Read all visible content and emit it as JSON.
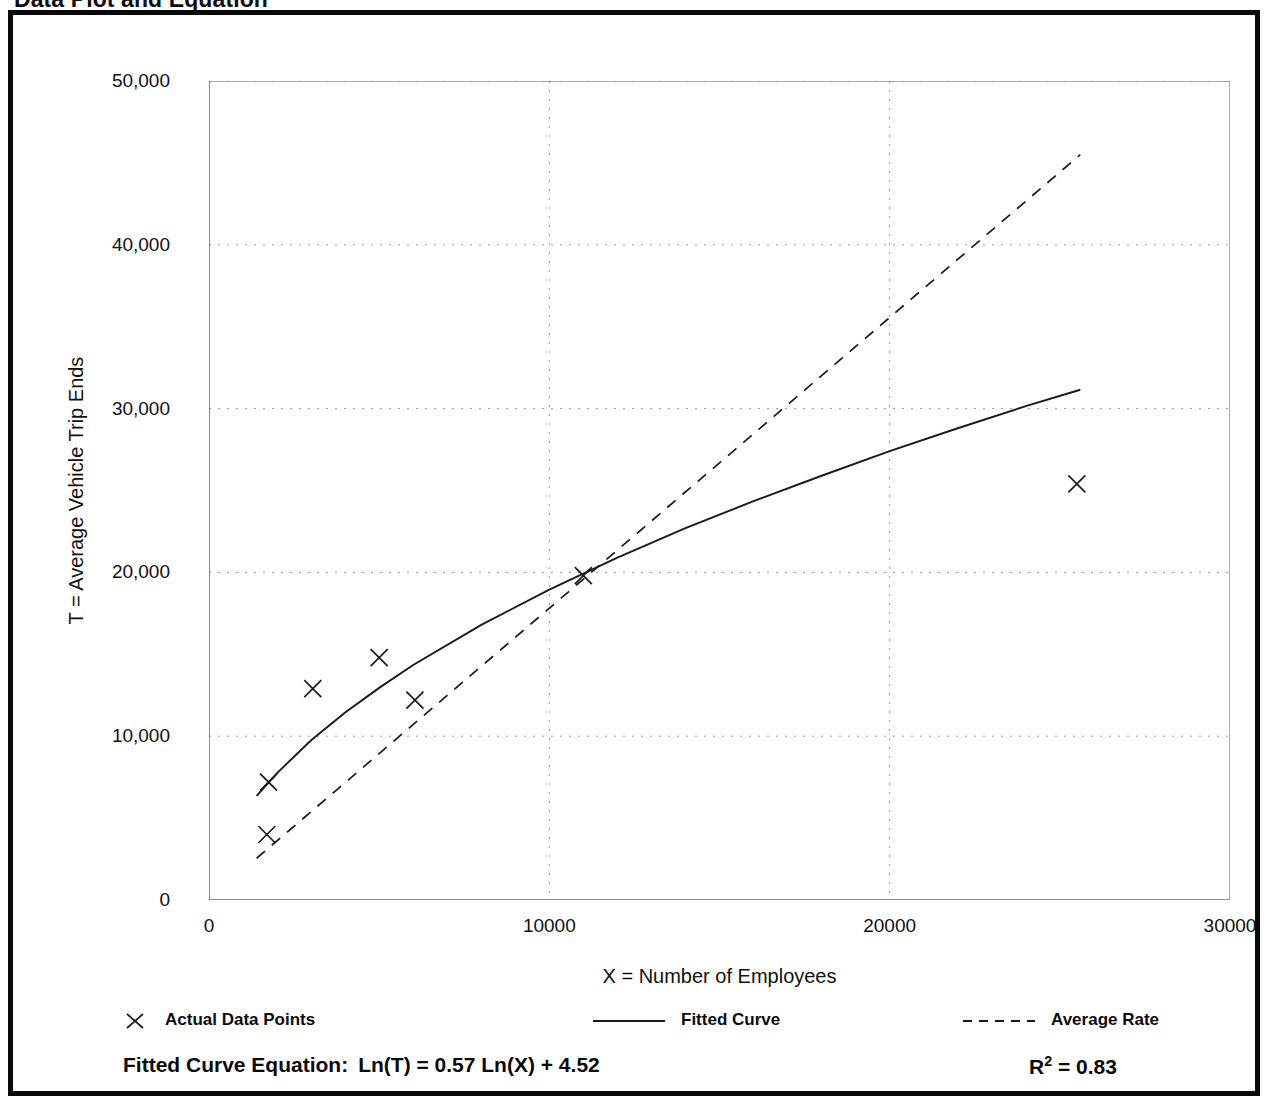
{
  "page": {
    "title": "Data Plot and Equation"
  },
  "chart_data": {
    "type": "scatter",
    "title": "Data Plot and Equation",
    "xlabel": "X = Number of Employees",
    "ylabel": "T = Average Vehicle Trip Ends",
    "xlim": [
      0,
      30000
    ],
    "ylim": [
      0,
      50000
    ],
    "grid": true,
    "x_ticks": [
      0,
      10000,
      20000,
      30000
    ],
    "x_tick_labels": [
      "0",
      "10000",
      "20000",
      "30000"
    ],
    "x_minor_ticks": [
      5000,
      15000,
      25000
    ],
    "y_ticks": [
      0,
      10000,
      20000,
      30000,
      40000,
      50000
    ],
    "y_tick_labels": [
      "0",
      "10,000",
      "20,000",
      "30,000",
      "40,000",
      "50,000"
    ],
    "y_minor_ticks": [
      5000,
      15000,
      25000,
      35000,
      45000
    ],
    "legend_position": "below-axes",
    "series": [
      {
        "name": "Actual Data Points",
        "type": "scatter",
        "marker": "x",
        "points": [
          {
            "x": 1700,
            "y": 4000
          },
          {
            "x": 1750,
            "y": 7200
          },
          {
            "x": 3050,
            "y": 12900
          },
          {
            "x": 5000,
            "y": 14800
          },
          {
            "x": 6050,
            "y": 12200
          },
          {
            "x": 11000,
            "y": 19800
          },
          {
            "x": 25500,
            "y": 25400
          }
        ]
      },
      {
        "name": "Fitted Curve",
        "type": "line",
        "style": "solid",
        "equation": "Ln(T) = 0.57 Ln(X) + 4.52",
        "points": [
          {
            "x": 1400,
            "y": 6350
          },
          {
            "x": 2000,
            "y": 7750
          },
          {
            "x": 3000,
            "y": 9750
          },
          {
            "x": 4000,
            "y": 11450
          },
          {
            "x": 5000,
            "y": 12950
          },
          {
            "x": 6000,
            "y": 14350
          },
          {
            "x": 8000,
            "y": 16800
          },
          {
            "x": 10000,
            "y": 18950
          },
          {
            "x": 12000,
            "y": 20900
          },
          {
            "x": 14000,
            "y": 22700
          },
          {
            "x": 16000,
            "y": 24350
          },
          {
            "x": 18000,
            "y": 25900
          },
          {
            "x": 20000,
            "y": 27400
          },
          {
            "x": 22000,
            "y": 28800
          },
          {
            "x": 24000,
            "y": 30150
          },
          {
            "x": 25600,
            "y": 31150
          }
        ]
      },
      {
        "name": "Average Rate",
        "type": "line",
        "style": "dashed",
        "points": [
          {
            "x": 1400,
            "y": 2550
          },
          {
            "x": 25600,
            "y": 45500
          }
        ]
      }
    ],
    "annotations": {
      "equation_label": "Fitted Curve Equation:",
      "equation_body": "Ln(T) = 0.57 Ln(X) + 4.52",
      "r_squared_symbol": "R",
      "r_squared_exponent": "2",
      "r_squared_value": "= 0.83"
    }
  },
  "legend": {
    "entries": [
      {
        "label": "Actual Data Points",
        "marker": "x-marker-icon"
      },
      {
        "label": "Fitted Curve",
        "marker": "solid-line-icon"
      },
      {
        "label": "Average Rate",
        "marker": "dashed-line-icon"
      }
    ]
  },
  "colors": {
    "frame": "#0a0a0a",
    "axis": "#5a5a5a",
    "grid": "#9a9a9a",
    "data": "#1a1a1a",
    "text": "#111111"
  }
}
